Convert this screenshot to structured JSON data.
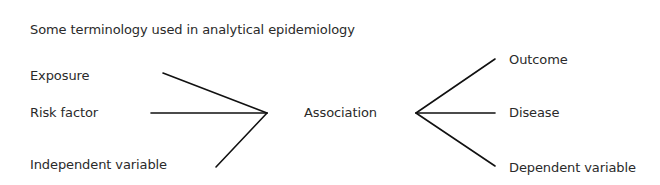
{
  "title": "Some terminology used in analytical epidemiology",
  "left_terms": [
    {
      "label": "Exposure"
    },
    {
      "label": "Risk factor"
    },
    {
      "label": "Independent variable"
    }
  ],
  "center_term": "Association",
  "right_terms": [
    {
      "label": "Outcome"
    },
    {
      "label": "Disease"
    },
    {
      "label": "Dependent variable"
    }
  ],
  "colors": {
    "text": "#2a2a2a",
    "lines": "#111111",
    "background": "#ffffff"
  }
}
